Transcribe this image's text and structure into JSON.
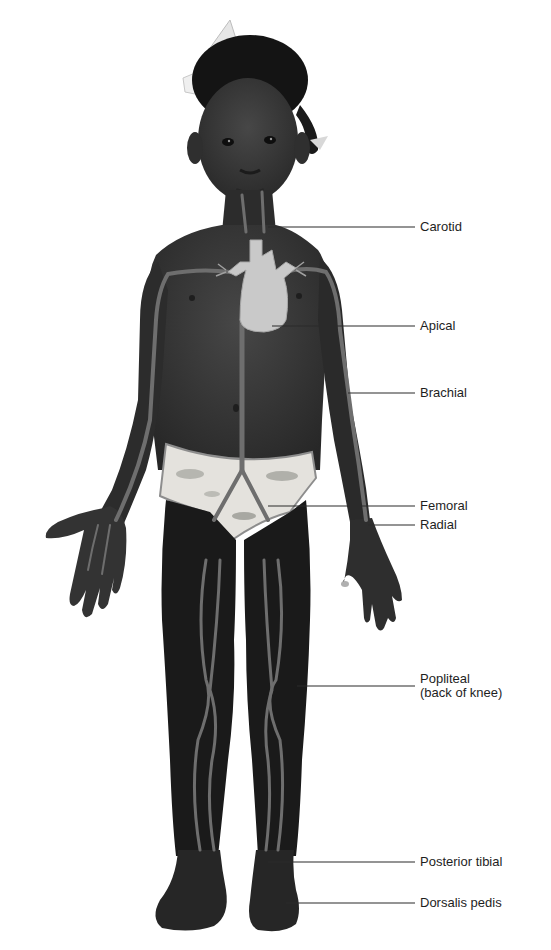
{
  "diagram": {
    "colors": {
      "background": "#ffffff",
      "skin": "#3b3b3b",
      "skin_dark": "#1c1c1c",
      "vessel": "#6e6e6e",
      "heart": "#c9c9c9",
      "underwear": "#e4e2dd",
      "leader_line": "#2a2a2a",
      "label_text": "#1e1e1e"
    },
    "labels": [
      {
        "id": "carotid",
        "text": "Carotid",
        "line2": "",
        "y": 227,
        "line_x1": 268,
        "line_y": 227
      },
      {
        "id": "apical",
        "text": "Apical",
        "line2": "",
        "y": 326,
        "line_x1": 272,
        "line_y": 326
      },
      {
        "id": "brachial",
        "text": "Brachial",
        "line2": "",
        "y": 393,
        "line_x1": 348,
        "line_y": 393
      },
      {
        "id": "femoral",
        "text": "Femoral",
        "line2": "",
        "y": 506,
        "line_x1": 268,
        "line_y": 506
      },
      {
        "id": "radial",
        "text": "Radial",
        "line2": "",
        "y": 525,
        "line_x1": 368,
        "line_y": 525
      },
      {
        "id": "popliteal",
        "text": "Popliteal",
        "line2": "(back of knee)",
        "y": 679,
        "line_x1": 297,
        "line_y": 686
      },
      {
        "id": "posterior-tibial",
        "text": "Posterior tibial",
        "line2": "",
        "y": 862,
        "line_x1": 268,
        "line_y": 862
      },
      {
        "id": "dorsalis-pedis",
        "text": "Dorsalis pedis",
        "line2": "",
        "y": 903,
        "line_x1": 286,
        "line_y": 903
      }
    ],
    "leader_line_end_x": 415
  }
}
